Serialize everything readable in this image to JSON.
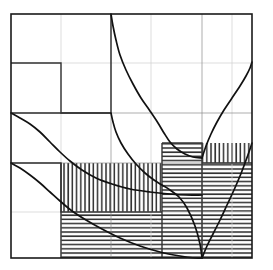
{
  "figure": {
    "background_color": "#ffffff",
    "frame": {
      "x0": 11,
      "y0": 14,
      "x1": 252,
      "y1": 258
    },
    "stroke_colors": {
      "frame": "#1a1a1a",
      "grid_major": "#8a8a8a",
      "grid_faint": "#cfcfcf",
      "step": "#333333",
      "curve": "#111111",
      "hatch": "#2b2b2b"
    }
  },
  "chart_data": {
    "type": "line",
    "xlabel": "",
    "ylabel": "",
    "xlim": [
      11,
      252
    ],
    "ylim": [
      14,
      258
    ],
    "grid": true,
    "legend": "none",
    "gridlines": {
      "vertical_major": [
        111,
        202
      ],
      "vertical_faint": [
        61,
        151,
        232
      ],
      "horizontal_major": [
        113,
        163
      ],
      "horizontal_faint": [
        63,
        212
      ]
    },
    "series": [
      {
        "name": "curve-upper-descending",
        "type": "hyperbola",
        "points": [
          [
            111,
            14
          ],
          [
            113,
            26
          ],
          [
            116,
            40
          ],
          [
            120,
            55
          ],
          [
            126,
            70
          ],
          [
            133,
            84
          ],
          [
            141,
            98
          ],
          [
            150,
            111
          ],
          [
            158,
            123
          ],
          [
            164,
            133
          ],
          [
            170,
            142
          ],
          [
            177,
            149
          ],
          [
            185,
            154
          ],
          [
            193,
            157
          ],
          [
            202,
            158
          ]
        ]
      },
      {
        "name": "curve-middle-descending",
        "type": "hyperbola",
        "points": [
          [
            111,
            113
          ],
          [
            113,
            122
          ],
          [
            116,
            132
          ],
          [
            121,
            143
          ],
          [
            128,
            154
          ],
          [
            136,
            164
          ],
          [
            145,
            173
          ],
          [
            154,
            180
          ],
          [
            162,
            185
          ],
          [
            170,
            190
          ],
          [
            179,
            197
          ],
          [
            187,
            208
          ],
          [
            195,
            226
          ],
          [
            200,
            244
          ],
          [
            202,
            258
          ]
        ]
      },
      {
        "name": "curve-left-upper-descending",
        "type": "hyperbola",
        "points": [
          [
            11,
            113
          ],
          [
            20,
            118
          ],
          [
            30,
            124
          ],
          [
            40,
            132
          ],
          [
            50,
            142
          ],
          [
            60,
            152
          ],
          [
            70,
            161
          ],
          [
            82,
            170
          ],
          [
            96,
            178
          ],
          [
            112,
            184
          ],
          [
            130,
            189
          ],
          [
            150,
            192
          ],
          [
            170,
            194
          ],
          [
            186,
            195
          ],
          [
            202,
            195
          ]
        ]
      },
      {
        "name": "curve-left-lower-descending",
        "type": "hyperbola",
        "points": [
          [
            11,
            163
          ],
          [
            20,
            168
          ],
          [
            30,
            175
          ],
          [
            40,
            183
          ],
          [
            50,
            192
          ],
          [
            60,
            201
          ],
          [
            72,
            211
          ],
          [
            86,
            220
          ],
          [
            102,
            229
          ],
          [
            120,
            238
          ],
          [
            140,
            246
          ],
          [
            160,
            252
          ],
          [
            180,
            256
          ],
          [
            195,
            258
          ],
          [
            202,
            258
          ]
        ]
      },
      {
        "name": "curve-right-upper-ascending",
        "type": "hyperbola",
        "points": [
          [
            202,
            158
          ],
          [
            206,
            146
          ],
          [
            211,
            134
          ],
          [
            217,
            122
          ],
          [
            224,
            110
          ],
          [
            232,
            98
          ],
          [
            240,
            86
          ],
          [
            246,
            76
          ],
          [
            250,
            68
          ],
          [
            252,
            62
          ]
        ]
      },
      {
        "name": "curve-right-lower-ascending",
        "type": "hyperbola",
        "points": [
          [
            202,
            258
          ],
          [
            207,
            246
          ],
          [
            213,
            234
          ],
          [
            220,
            220
          ],
          [
            227,
            205
          ],
          [
            234,
            190
          ],
          [
            240,
            176
          ],
          [
            245,
            163
          ],
          [
            249,
            152
          ],
          [
            252,
            143
          ]
        ]
      }
    ],
    "step_polylines": [
      {
        "name": "step-top-left",
        "points": [
          [
            11,
            63
          ],
          [
            61,
            63
          ],
          [
            61,
            113
          ],
          [
            111,
            113
          ]
        ]
      },
      {
        "name": "step-upper-band",
        "points": [
          [
            11,
            113
          ],
          [
            111,
            113
          ]
        ]
      },
      {
        "name": "step-lower-band",
        "points": [
          [
            11,
            163
          ],
          [
            61,
            163
          ],
          [
            61,
            212
          ],
          [
            162,
            212
          ]
        ]
      },
      {
        "name": "step-vertical-mid",
        "points": [
          [
            111,
            14
          ],
          [
            111,
            113
          ]
        ]
      },
      {
        "name": "step-right-upper",
        "points": [
          [
            162,
            143
          ],
          [
            202,
            143
          ],
          [
            202,
            258
          ]
        ]
      },
      {
        "name": "step-right-lower",
        "points": [
          [
            202,
            163
          ],
          [
            252,
            163
          ]
        ]
      }
    ],
    "hatched_regions": [
      {
        "name": "region-upper-right-horizontal",
        "pattern": "horizontal",
        "x": 162,
        "y": 143,
        "width": 40,
        "height": 115
      },
      {
        "name": "region-upper-right-vertical",
        "pattern": "vertical",
        "x": 202,
        "y": 143,
        "width": 50,
        "height": 20
      },
      {
        "name": "region-lower-right-horizontal",
        "pattern": "horizontal",
        "x": 202,
        "y": 163,
        "width": 50,
        "height": 95
      },
      {
        "name": "region-mid-left-vertical",
        "pattern": "vertical",
        "x": 61,
        "y": 163,
        "width": 101,
        "height": 49
      },
      {
        "name": "region-bottom-left-horizontal",
        "pattern": "horizontal",
        "x": 61,
        "y": 212,
        "width": 101,
        "height": 46
      }
    ]
  }
}
